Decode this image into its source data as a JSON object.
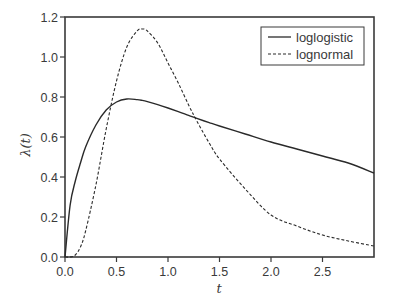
{
  "chart_data": {
    "type": "line",
    "title": "",
    "xlabel": "t",
    "ylabel": "λ(t)",
    "xlim": [
      0,
      3.0
    ],
    "ylim": [
      0,
      1.2
    ],
    "grid": false,
    "legend_position": "upper right",
    "x_ticks": [
      "0.0",
      "0.5",
      "1.0",
      "1.5",
      "2.0",
      "2.5"
    ],
    "y_ticks": [
      "0.0",
      "0.2",
      "0.4",
      "0.6",
      "0.8",
      "1.0",
      "1.2"
    ],
    "x": [
      0.0,
      0.05,
      0.1,
      0.15,
      0.2,
      0.3,
      0.4,
      0.5,
      0.6,
      0.7,
      0.75,
      0.8,
      0.9,
      1.0,
      1.1,
      1.2,
      1.28,
      1.4,
      1.5,
      1.75,
      2.0,
      2.25,
      2.5,
      2.75,
      3.0
    ],
    "series": [
      {
        "name": "loglogistic",
        "style": "solid",
        "values": [
          0.0,
          0.26,
          0.38,
          0.47,
          0.55,
          0.66,
          0.735,
          0.775,
          0.79,
          0.787,
          0.783,
          0.777,
          0.762,
          0.745,
          0.727,
          0.708,
          0.693,
          0.672,
          0.655,
          0.615,
          0.575,
          0.54,
          0.505,
          0.47,
          0.42
        ]
      },
      {
        "name": "lognormal",
        "style": "dashed",
        "values": [
          0.0,
          0.0,
          0.01,
          0.05,
          0.13,
          0.36,
          0.64,
          0.88,
          1.05,
          1.13,
          1.14,
          1.13,
          1.07,
          0.97,
          0.87,
          0.76,
          0.68,
          0.57,
          0.49,
          0.34,
          0.21,
          0.155,
          0.11,
          0.08,
          0.055
        ]
      }
    ]
  },
  "legend": {
    "items": [
      {
        "label": "loglogistic",
        "style": "solid"
      },
      {
        "label": "lognormal",
        "style": "dashed"
      }
    ]
  },
  "colors": {
    "line": "#2a2a2a",
    "axis": "#3a3a3a",
    "text": "#3a3a3a"
  }
}
